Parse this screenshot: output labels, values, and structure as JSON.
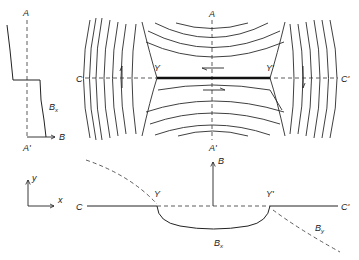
{
  "figure": {
    "top_panel": {
      "labels": {
        "A_top": "A",
        "A_bottom": "A'",
        "C_left": "C",
        "C_right": "C'",
        "Y_left": "Y",
        "Y_right": "Y'"
      },
      "flow_arrows": [
        "up (left of Y)",
        "left (above sheet)",
        "right (below sheet)",
        "down (right of Y')"
      ]
    },
    "left_panel": {
      "labels": {
        "A_top": "A",
        "A_bottom": "A'",
        "B_axis": "B",
        "profile": "B",
        "profile_sub": "x"
      }
    },
    "bottom_panel": {
      "labels": {
        "C_left": "C",
        "C_right": "C'",
        "Y_left": "Y",
        "Y_right": "Y'",
        "B_axis": "B",
        "Bx": "B",
        "Bx_sub": "x",
        "By": "B",
        "By_sub": "y"
      },
      "axes": {
        "x": "x",
        "y": "y"
      }
    },
    "colors": {
      "ink": "#222222",
      "background": "#ffffff"
    }
  }
}
